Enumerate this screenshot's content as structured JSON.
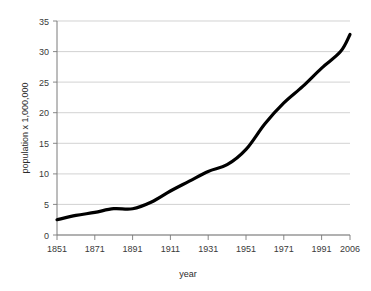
{
  "chart": {
    "title": "",
    "background_color": "#ffffff",
    "line_color": "#000000",
    "gridline_color": "#bfbfbf",
    "axis_color": "#7a7a7a"
  },
  "axes": {
    "y_title": "population x 1,000,000",
    "x_title": "year",
    "y_ticks": [
      "0",
      "5",
      "10",
      "15",
      "20",
      "25",
      "30",
      "35"
    ],
    "x_ticks": [
      "1851",
      "1871",
      "1891",
      "1911",
      "1931",
      "1951",
      "1971",
      "1991",
      "2006"
    ]
  },
  "chart_data": {
    "type": "line",
    "title": "",
    "xlabel": "year",
    "ylabel": "population x 1,000,000",
    "xlim": [
      1851,
      2006
    ],
    "ylim": [
      0,
      35
    ],
    "grid": true,
    "legend": false,
    "x_tick_labels": [
      "1851",
      "1871",
      "1891",
      "1911",
      "1931",
      "1951",
      "1971",
      "1991",
      "2006"
    ],
    "y_tick_labels": [
      "0",
      "5",
      "10",
      "15",
      "20",
      "25",
      "30",
      "35"
    ],
    "x": [
      1851,
      1861,
      1871,
      1881,
      1891,
      1901,
      1911,
      1921,
      1931,
      1941,
      1951,
      1961,
      1971,
      1981,
      1991,
      2001,
      2006
    ],
    "series": [
      {
        "name": "population",
        "values": [
          2.5,
          3.2,
          3.7,
          4.3,
          4.3,
          5.4,
          7.2,
          8.8,
          10.4,
          11.5,
          14.0,
          18.2,
          21.6,
          24.3,
          27.3,
          30.0,
          32.8
        ]
      }
    ]
  }
}
